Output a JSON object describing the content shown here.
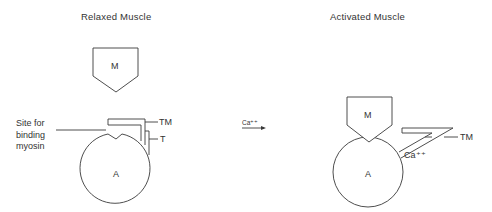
{
  "panels": {
    "relaxed": {
      "title": "Relaxed Muscle",
      "myosin_label": "M",
      "actin_label": "A",
      "tropomyosin_label": "TM",
      "troponin_label": "T",
      "binding_site_label_line1": "Site for",
      "binding_site_label_line2": "binding",
      "binding_site_label_line3": "myosin"
    },
    "transition": {
      "ion_label": "Ca⁺⁺"
    },
    "activated": {
      "title": "Activated Muscle",
      "myosin_label": "M",
      "actin_label": "A",
      "tropomyosin_label": "TM",
      "calcium_label": "Ca⁺⁺"
    }
  },
  "colors": {
    "stroke": "#3a3a3a",
    "text": "#333333",
    "background": "#ffffff"
  }
}
